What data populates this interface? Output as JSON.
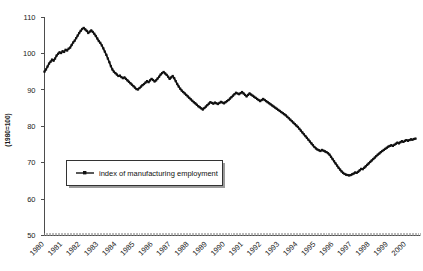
{
  "chart_data": {
    "type": "line",
    "title": "",
    "xlabel": "",
    "ylabel": "(1980=100)",
    "ylim": [
      50,
      110
    ],
    "ytick_values": [
      50,
      60,
      70,
      80,
      90,
      100,
      110
    ],
    "ytick_labels": [
      "50",
      "60",
      "70",
      "80",
      "90",
      "100",
      "110"
    ],
    "xlim": [
      1980,
      2000.75
    ],
    "xtick_labels": [
      "1980",
      "1981",
      "1982",
      "1983",
      "1984",
      "1985",
      "1986",
      "1987",
      "1988",
      "1989",
      "1990",
      "1991",
      "1992",
      "1993",
      "1994",
      "1995",
      "1996",
      "1997",
      "1998",
      "1999",
      "2000"
    ],
    "grid": false,
    "legend_position": "inside-left",
    "series": [
      {
        "name": "index of manufacturing employment",
        "color": "#111111",
        "marker": "square",
        "x": [
          1980.0,
          1980.083,
          1980.167,
          1980.25,
          1980.333,
          1980.417,
          1980.5,
          1980.583,
          1980.667,
          1980.75,
          1980.833,
          1980.917,
          1981.0,
          1981.083,
          1981.167,
          1981.25,
          1981.333,
          1981.417,
          1981.5,
          1981.583,
          1981.667,
          1981.75,
          1981.833,
          1981.917,
          1982.0,
          1982.083,
          1982.167,
          1982.25,
          1982.333,
          1982.417,
          1982.5,
          1982.583,
          1982.667,
          1982.75,
          1982.833,
          1982.917,
          1983.0,
          1983.083,
          1983.167,
          1983.25,
          1983.333,
          1983.417,
          1983.5,
          1983.583,
          1983.667,
          1983.75,
          1983.833,
          1983.917,
          1984.0,
          1984.083,
          1984.167,
          1984.25,
          1984.333,
          1984.417,
          1984.5,
          1984.583,
          1984.667,
          1984.75,
          1984.833,
          1984.917,
          1985.0,
          1985.083,
          1985.167,
          1985.25,
          1985.333,
          1985.417,
          1985.5,
          1985.583,
          1985.667,
          1985.75,
          1985.833,
          1985.917,
          1986.0,
          1986.083,
          1986.167,
          1986.25,
          1986.333,
          1986.417,
          1986.5,
          1986.583,
          1986.667,
          1986.75,
          1986.833,
          1986.917,
          1987.0,
          1987.083,
          1987.167,
          1987.25,
          1987.333,
          1987.417,
          1987.5,
          1987.583,
          1987.667,
          1987.75,
          1987.833,
          1987.917,
          1988.0,
          1988.083,
          1988.167,
          1988.25,
          1988.333,
          1988.417,
          1988.5,
          1988.583,
          1988.667,
          1988.75,
          1988.833,
          1988.917,
          1989.0,
          1989.083,
          1989.167,
          1989.25,
          1989.333,
          1989.417,
          1989.5,
          1989.583,
          1989.667,
          1989.75,
          1989.833,
          1989.917,
          1990.0,
          1990.083,
          1990.167,
          1990.25,
          1990.333,
          1990.417,
          1990.5,
          1990.583,
          1990.667,
          1990.75,
          1990.833,
          1990.917,
          1991.0,
          1991.083,
          1991.167,
          1991.25,
          1991.333,
          1991.417,
          1991.5,
          1991.583,
          1991.667,
          1991.75,
          1991.833,
          1991.917,
          1992.0,
          1992.083,
          1992.167,
          1992.25,
          1992.333,
          1992.417,
          1992.5,
          1992.583,
          1992.667,
          1992.75,
          1992.833,
          1992.917,
          1993.0,
          1993.083,
          1993.167,
          1993.25,
          1993.333,
          1993.417,
          1993.5,
          1993.583,
          1993.667,
          1993.75,
          1993.833,
          1993.917,
          1994.0,
          1994.083,
          1994.167,
          1994.25,
          1994.333,
          1994.417,
          1994.5,
          1994.583,
          1994.667,
          1994.75,
          1994.833,
          1994.917,
          1995.0,
          1995.083,
          1995.167,
          1995.25,
          1995.333,
          1995.417,
          1995.5,
          1995.583,
          1995.667,
          1995.75,
          1995.833,
          1995.917,
          1996.0,
          1996.083,
          1996.167,
          1996.25,
          1996.333,
          1996.417,
          1996.5,
          1996.583,
          1996.667,
          1996.75,
          1996.833,
          1996.917,
          1997.0,
          1997.083,
          1997.167,
          1997.25,
          1997.333,
          1997.417,
          1997.5,
          1997.583,
          1997.667,
          1997.75,
          1997.833,
          1997.917,
          1998.0,
          1998.083,
          1998.167,
          1998.25,
          1998.333,
          1998.417,
          1998.5,
          1998.583,
          1998.667,
          1998.75,
          1998.833,
          1998.917,
          1999.0,
          1999.083,
          1999.167,
          1999.25,
          1999.333,
          1999.417,
          1999.5,
          1999.583,
          1999.667,
          1999.75,
          1999.833,
          1999.917,
          2000.0,
          2000.083,
          2000.167,
          2000.25,
          2000.333,
          2000.417,
          2000.5
        ],
        "values": [
          95.0,
          95.6,
          96.4,
          97.2,
          97.7,
          98.3,
          98.0,
          98.6,
          99.4,
          99.9,
          100.3,
          100.1,
          100.6,
          100.4,
          101.0,
          100.8,
          101.3,
          101.6,
          102.3,
          103.0,
          103.5,
          104.2,
          104.9,
          105.6,
          106.2,
          106.7,
          107.0,
          106.6,
          106.2,
          105.6,
          106.0,
          106.3,
          105.9,
          105.4,
          104.8,
          104.1,
          103.4,
          102.9,
          102.2,
          101.4,
          100.5,
          99.6,
          98.6,
          97.6,
          96.5,
          95.6,
          95.0,
          94.6,
          94.2,
          93.8,
          93.9,
          93.5,
          93.2,
          93.4,
          93.0,
          92.6,
          92.2,
          91.8,
          91.4,
          91.0,
          90.6,
          90.2,
          90.1,
          90.5,
          90.9,
          91.3,
          91.6,
          92.0,
          92.4,
          92.1,
          92.6,
          93.0,
          92.7,
          92.3,
          92.6,
          93.1,
          93.6,
          94.2,
          94.6,
          94.9,
          94.5,
          94.1,
          93.6,
          93.0,
          93.4,
          93.8,
          93.2,
          92.4,
          91.6,
          90.9,
          90.3,
          89.8,
          89.4,
          89.0,
          88.6,
          88.2,
          87.8,
          87.4,
          87.0,
          86.6,
          86.3,
          85.9,
          85.5,
          85.2,
          84.9,
          84.6,
          85.0,
          85.4,
          85.8,
          86.2,
          86.6,
          86.4,
          86.2,
          86.5,
          86.3,
          86.1,
          86.4,
          86.7,
          86.5,
          86.3,
          86.6,
          86.9,
          87.2,
          87.6,
          88.0,
          88.4,
          88.8,
          89.2,
          89.0,
          88.8,
          89.1,
          89.4,
          89.0,
          88.6,
          88.2,
          88.6,
          89.0,
          88.7,
          88.4,
          88.1,
          87.8,
          87.5,
          87.2,
          86.9,
          87.2,
          87.5,
          87.2,
          86.9,
          86.6,
          86.3,
          86.0,
          85.7,
          85.4,
          85.1,
          84.8,
          84.5,
          84.2,
          83.9,
          83.6,
          83.3,
          83.0,
          82.6,
          82.2,
          81.8,
          81.4,
          81.0,
          80.6,
          80.2,
          79.8,
          79.3,
          78.8,
          78.3,
          77.8,
          77.3,
          76.8,
          76.3,
          75.8,
          75.3,
          74.8,
          74.3,
          73.9,
          73.6,
          73.4,
          73.2,
          73.5,
          73.3,
          73.1,
          72.9,
          72.6,
          72.2,
          71.6,
          71.0,
          70.4,
          69.8,
          69.2,
          68.6,
          68.1,
          67.6,
          67.2,
          66.9,
          66.7,
          66.6,
          66.5,
          66.6,
          66.8,
          67.0,
          67.3,
          67.2,
          67.5,
          67.9,
          68.3,
          68.2,
          68.6,
          69.0,
          69.4,
          69.8,
          70.2,
          70.6,
          71.0,
          71.4,
          71.8,
          72.2,
          72.5,
          72.9,
          73.2,
          73.5,
          73.8,
          74.1,
          74.4,
          74.6,
          74.8,
          74.6,
          74.9,
          75.2,
          75.5,
          75.3,
          75.6,
          75.9,
          75.7,
          76.0,
          76.2,
          76.0,
          76.2,
          76.4,
          76.3,
          76.5,
          76.6
        ]
      }
    ],
    "legend": [
      {
        "label": "index of manufacturing employment"
      }
    ]
  },
  "legend": {
    "entry_label": "index of manufacturing employment"
  },
  "axes": {
    "y_title": "(1980=100)"
  }
}
